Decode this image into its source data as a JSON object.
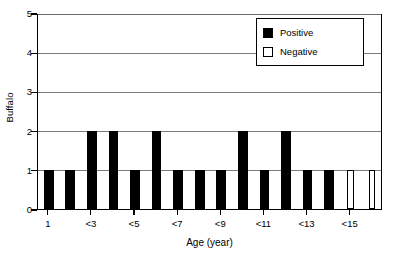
{
  "chart_data": {
    "type": "bar",
    "title": "",
    "subtitle": "",
    "xlabel": "Age (year)",
    "ylabel": "Buffalo",
    "ylim": [
      0,
      5
    ],
    "yticks": [
      0,
      1,
      2,
      3,
      4,
      5
    ],
    "ytick_labels": [
      "0",
      "1",
      "2",
      "3",
      "4",
      "5"
    ],
    "grid": "horizontal",
    "legend_position": "top-right",
    "categories": [
      "1",
      "2",
      "<3",
      "4",
      "<5",
      "6",
      "<7",
      "8",
      "<9",
      "10",
      "<11",
      "12",
      "<13",
      "14",
      "<15",
      "16"
    ],
    "xtick_labels": [
      "1",
      "<3",
      "<5",
      "<7",
      "<9",
      "<11",
      "<13",
      "<15"
    ],
    "xtick_category_indices": [
      0,
      2,
      4,
      6,
      8,
      10,
      12,
      14
    ],
    "series": [
      {
        "name": "Positive",
        "color": "#000000",
        "fill": "solid",
        "values": [
          1,
          1,
          2,
          2,
          1,
          2,
          1,
          1,
          1,
          2,
          1,
          2,
          1,
          1,
          0,
          0
        ]
      },
      {
        "name": "Negative",
        "color": "#ffffff",
        "fill": "hollow",
        "values": [
          0,
          0,
          0,
          0,
          0,
          0,
          0,
          0,
          0,
          0,
          0,
          0,
          0,
          0,
          1,
          1
        ]
      }
    ]
  },
  "legend": {
    "items": [
      {
        "label": "Positive",
        "swatch": "filled"
      },
      {
        "label": "Negative",
        "swatch": "hollow"
      }
    ]
  },
  "colors": {
    "positive": "#000000",
    "negative": "#ffffff",
    "axis": "#000000",
    "grid": "#7d7d7d",
    "background": "#ffffff"
  }
}
